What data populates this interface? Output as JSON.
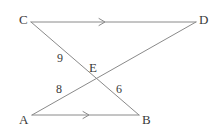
{
  "figure": {
    "background_color": "#ffffff",
    "stroke_color": "#8a8a8a",
    "text_color": "#3a3a3a",
    "vertices": [
      {
        "name": "C",
        "label": "C",
        "x": 31,
        "y": 22,
        "label_x": 19,
        "label_y": 24
      },
      {
        "name": "D",
        "label": "D",
        "x": 196,
        "y": 22,
        "label_x": 199,
        "label_y": 24
      },
      {
        "name": "E",
        "label": "E",
        "x": 95,
        "y": 78,
        "label_x": 89,
        "label_y": 72
      },
      {
        "name": "A",
        "label": "A",
        "x": 32,
        "y": 115,
        "label_x": 19,
        "label_y": 124
      },
      {
        "name": "B",
        "label": "B",
        "x": 139,
        "y": 115,
        "label_x": 142,
        "label_y": 124
      }
    ],
    "segments": [
      {
        "name": "segment-CD",
        "from": "C",
        "to": "D",
        "arrow": true,
        "arrow_x": 104,
        "arrow_y": 22
      },
      {
        "name": "segment-AB",
        "from": "A",
        "to": "B",
        "arrow": true,
        "arrow_x": 88,
        "arrow_y": 115
      },
      {
        "name": "segment-CB",
        "from": "C",
        "to": "B",
        "arrow": false
      },
      {
        "name": "segment-AD",
        "from": "A",
        "to": "D",
        "arrow": false
      }
    ],
    "measurements": [
      {
        "name": "length-CE",
        "value": "9",
        "segment": "C-E",
        "x": 57,
        "y": 62
      },
      {
        "name": "length-AE",
        "value": "8",
        "segment": "A-E",
        "x": 56,
        "y": 93
      },
      {
        "name": "length-EB",
        "value": "6",
        "segment": "E-B",
        "x": 116,
        "y": 93
      }
    ]
  }
}
